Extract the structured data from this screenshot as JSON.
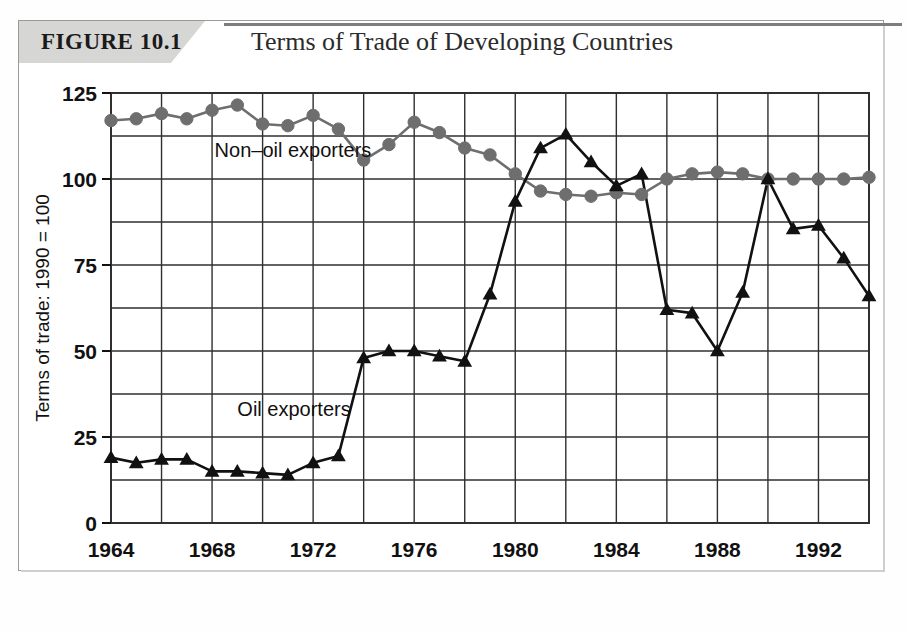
{
  "figure": {
    "tag": "FIGURE 10.1",
    "title": "Terms of Trade of Developing Countries"
  },
  "chart_data": {
    "type": "line",
    "title": "Terms of Trade of Developing Countries",
    "xlabel": "Year",
    "ylabel": "Terms of trade: 1990 = 100",
    "xlim": [
      1964,
      1994
    ],
    "ylim": [
      0,
      125
    ],
    "xticks": [
      1964,
      1968,
      1972,
      1976,
      1980,
      1984,
      1988,
      1992
    ],
    "xtick_labels": [
      "1964",
      "1968",
      "1972",
      "1976",
      "1980",
      "1984",
      "1988",
      "1992"
    ],
    "yticks": [
      0,
      25,
      50,
      75,
      100,
      125
    ],
    "ytick_labels": [
      "0",
      "25",
      "50",
      "75",
      "100",
      "125"
    ],
    "x_minor_step": 2,
    "y_minor_step": 12.5,
    "grid": true,
    "legend_position": "inline-annotations",
    "x": [
      1964,
      1965,
      1966,
      1967,
      1968,
      1969,
      1970,
      1971,
      1972,
      1973,
      1974,
      1975,
      1976,
      1977,
      1978,
      1979,
      1980,
      1981,
      1982,
      1983,
      1984,
      1985,
      1986,
      1987,
      1988,
      1989,
      1990,
      1991,
      1992,
      1993,
      1994
    ],
    "series": [
      {
        "name": "Non-oil exporters",
        "label": "Non–oil exporters",
        "marker": "circle",
        "color": "#6e6e6e",
        "values": [
          117,
          117.5,
          119,
          117.5,
          120,
          121.5,
          116,
          115.5,
          118.5,
          114.5,
          105.5,
          110,
          116.5,
          113.5,
          109,
          107,
          101.5,
          96.5,
          95.5,
          95,
          96,
          95.5,
          100,
          101.5,
          102,
          101.5,
          100,
          100,
          100,
          100,
          100.5
        ]
      },
      {
        "name": "Oil exporters",
        "label": "Oil exporters",
        "marker": "triangle",
        "color": "#111111",
        "values": [
          19,
          17.5,
          18.5,
          18.5,
          15,
          15,
          14.5,
          14,
          17.5,
          19.5,
          48,
          50,
          50,
          48.5,
          47,
          66.5,
          93.5,
          109,
          113,
          105,
          98,
          101.5,
          62,
          61,
          50,
          67,
          100,
          85.5,
          86.5,
          77,
          66
        ]
      }
    ],
    "annotations": [
      {
        "text": "Non–oil exporters",
        "x": 1968.1,
        "y": 106.5
      },
      {
        "text": "Oil exporters",
        "x": 1969.0,
        "y": 31.0
      }
    ]
  },
  "colors": {
    "non_oil_line": "#6e6e6e",
    "oil_line": "#111111",
    "grid": "#2f2f2f",
    "banner": "#d6d6d4"
  }
}
